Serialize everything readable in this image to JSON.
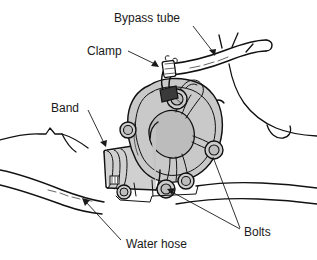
{
  "figure": {
    "type": "technical-line-diagram",
    "width": 317,
    "height": 260,
    "background_color": "#ffffff",
    "ink_color": "#111111",
    "part_fill_color": "#c4c4c4",
    "part_fill_light": "#d8d8d8",
    "part_fill_dark": "#aaaaaa"
  },
  "labels": [
    {
      "id": "bypass-tube",
      "text": "Bypass tube",
      "x": 114,
      "y": 22,
      "leader": {
        "from": [
          193,
          26
        ],
        "to": [
          215,
          55
        ],
        "arrow": true
      }
    },
    {
      "id": "clamp",
      "text": "Clamp",
      "x": 87,
      "y": 55,
      "leader": {
        "from": [
          128,
          52
        ],
        "to": [
          158,
          67
        ],
        "arrow": true
      }
    },
    {
      "id": "band",
      "text": "Band",
      "x": 51,
      "y": 112,
      "leader": {
        "from": [
          88,
          110
        ],
        "to": [
          106,
          147
        ],
        "arrow": true
      }
    },
    {
      "id": "bolts",
      "text": "Bolts",
      "x": 244,
      "y": 236,
      "leaders": [
        {
          "from": [
            240,
            228
          ],
          "to": [
            212,
            150
          ],
          "arrow": false
        },
        {
          "from": [
            240,
            230
          ],
          "to": [
            166,
            190
          ],
          "arrow": true
        }
      ]
    },
    {
      "id": "water-hose",
      "text": "Water hose",
      "x": 126,
      "y": 248,
      "leader": {
        "from": [
          120,
          240
        ],
        "to": [
          82,
          198
        ],
        "arrow": true
      }
    }
  ],
  "parts": [
    {
      "id": "pump-housing",
      "name": "water pump housing",
      "shaded": true
    },
    {
      "id": "pump-hub",
      "name": "pump center hub",
      "shaded": true
    },
    {
      "id": "hose-neck",
      "name": "hose neck / outlet",
      "shaded": true
    },
    {
      "id": "bypass-tube-part",
      "name": "bypass tube",
      "shaded": false
    },
    {
      "id": "hose-clamp",
      "name": "spring clamp on bypass tube",
      "shaded": false
    },
    {
      "id": "hose-band",
      "name": "band clamp on water hose",
      "shaded": false
    },
    {
      "id": "bolt-top",
      "name": "upper mounting bolt",
      "shaded": true
    },
    {
      "id": "bolt-right",
      "name": "right mounting bolt",
      "shaded": true
    },
    {
      "id": "bolt-bottom",
      "name": "lower mounting bolt",
      "shaded": true
    },
    {
      "id": "bolt-left",
      "name": "left mounting bolt",
      "shaded": true
    },
    {
      "id": "bolt-lower-left",
      "name": "lower-left mounting bolt",
      "shaded": true
    },
    {
      "id": "bolt-inner-bottom",
      "name": "inner bottom mounting bolt",
      "shaded": true
    },
    {
      "id": "water-hose-part",
      "name": "water hose",
      "shaded": false
    },
    {
      "id": "engine-background",
      "name": "engine block background contours",
      "shaded": false
    }
  ]
}
